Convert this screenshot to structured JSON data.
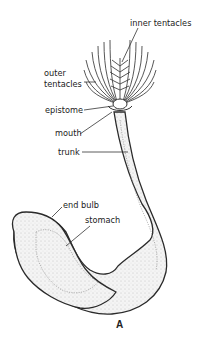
{
  "figure": {
    "caption": "A",
    "labels": {
      "inner_tentacles": "inner tentacles",
      "outer_tentacles_line1": "outer",
      "outer_tentacles_line2": "tentacles",
      "epistome": "epistome",
      "mouth": "mouth",
      "trunk": "trunk",
      "end_bulb": "end bulb",
      "stomach": "stomach"
    }
  }
}
